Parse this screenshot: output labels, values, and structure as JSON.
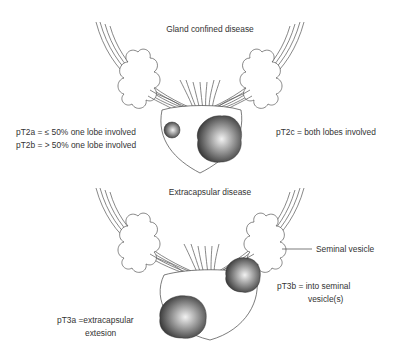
{
  "panels": [
    {
      "title": "Gland confined disease",
      "labels": {
        "left_line1": "pT2a = ≤ 50% one lobe involved",
        "left_line2": "pT2b = > 50% one lobe involved",
        "right": "pT2c = both lobes involved"
      }
    },
    {
      "title": "Extracapsular disease",
      "labels": {
        "seminal_vesicle": "Seminal vesicle",
        "right_line1": "pT3b = into seminal",
        "right_line2": "vesicle(s)",
        "left_line1": "pT3a =extracapsular",
        "left_line2": "extesion"
      }
    }
  ],
  "colors": {
    "line": "#444444",
    "tumor_dark": "#3a3a3a",
    "tumor_light": "#e8e8e8",
    "background": "#ffffff"
  }
}
